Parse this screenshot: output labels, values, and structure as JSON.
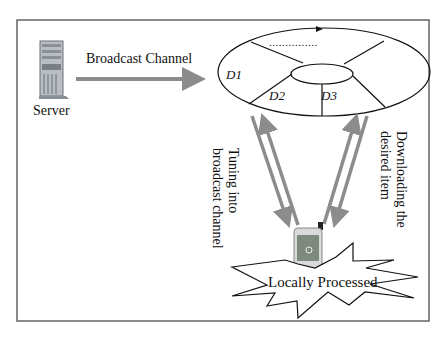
{
  "diagram": {
    "server_label": "Server",
    "channel_label": "Broadcast Channel",
    "segments": {
      "d1": "D1",
      "d2": "D2",
      "d3": "D3",
      "ellipsis": "..............."
    },
    "tuning_label": [
      "Tuning into",
      "broadcast channel"
    ],
    "download_label": [
      "Downloading the",
      "desired item"
    ],
    "process_label": "Locally Processed"
  },
  "colors": {
    "arrow": "#8c8c8c",
    "frame": "#555555",
    "line": "#111111"
  }
}
